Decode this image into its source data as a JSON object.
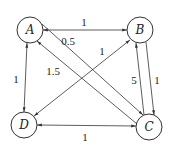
{
  "diagram": {
    "type": "directed-weighted-graph",
    "colors": {
      "stroke": "#333333",
      "text": "#222222",
      "background": "#ffffff"
    },
    "nodes": [
      {
        "id": "A",
        "label": "A",
        "x": 30,
        "y": 30
      },
      {
        "id": "B",
        "label": "B",
        "x": 140,
        "y": 30
      },
      {
        "id": "C",
        "label": "C",
        "x": 149,
        "y": 127
      },
      {
        "id": "D",
        "label": "D",
        "x": 24,
        "y": 125
      }
    ],
    "edges": [
      {
        "from": "A",
        "to": "B",
        "bidirectional": true,
        "label": "1"
      },
      {
        "from": "A",
        "to": "D",
        "bidirectional": true,
        "label": "1"
      },
      {
        "from": "D",
        "to": "C",
        "bidirectional": true,
        "label": "1"
      },
      {
        "from": "B",
        "to": "D",
        "bidirectional": true,
        "label": "1"
      },
      {
        "from": "A",
        "to": "C",
        "bidirectional": false,
        "label": "0.5"
      },
      {
        "from": "C",
        "to": "A",
        "bidirectional": false,
        "label": "1.5"
      },
      {
        "from": "C",
        "to": "B",
        "bidirectional": false,
        "label": "5"
      },
      {
        "from": "B",
        "to": "C",
        "bidirectional": false,
        "label": "1"
      }
    ],
    "labels": {
      "node_a": "A",
      "node_b": "B",
      "node_c": "C",
      "node_d": "D",
      "ab": "1",
      "ad": "1",
      "dc": "1",
      "bd": "1",
      "ac": "0.5",
      "ca": "1.5",
      "cb": "5",
      "bc": "1"
    }
  }
}
